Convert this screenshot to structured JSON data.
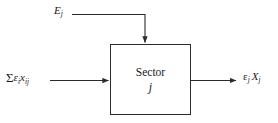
{
  "figure": {
    "type": "block-diagram",
    "background_color": "#ffffff",
    "line_color": "#2b2b2b",
    "text_color": "#1a1a1a"
  },
  "block": {
    "title": "Sector",
    "index": "j"
  },
  "inputs": {
    "top": {
      "symbol": "E",
      "subscript": "j",
      "plain": "E_j"
    },
    "left": {
      "sigma": "Σ",
      "epsilon": "ε",
      "epsilon_subscript": "i",
      "variable": "x",
      "variable_subscript": "ij",
      "plain": "Σε_i x_ij"
    }
  },
  "outputs": {
    "right": {
      "epsilon": "ε",
      "epsilon_subscript": "j",
      "variable": "X",
      "variable_subscript": "j",
      "plain": "ε_j X_j"
    }
  },
  "geometry": {
    "box": {
      "x": 110,
      "y": 44,
      "width": 81,
      "height": 71
    },
    "top_arrow": {
      "from_x": 72,
      "from_y": 14,
      "corner_x": 145,
      "to_y": 44
    },
    "left_arrow": {
      "from_x": 50,
      "to_x": 110,
      "y": 80
    },
    "right_arrow": {
      "from_x": 191,
      "to_x": 237,
      "y": 80
    }
  }
}
